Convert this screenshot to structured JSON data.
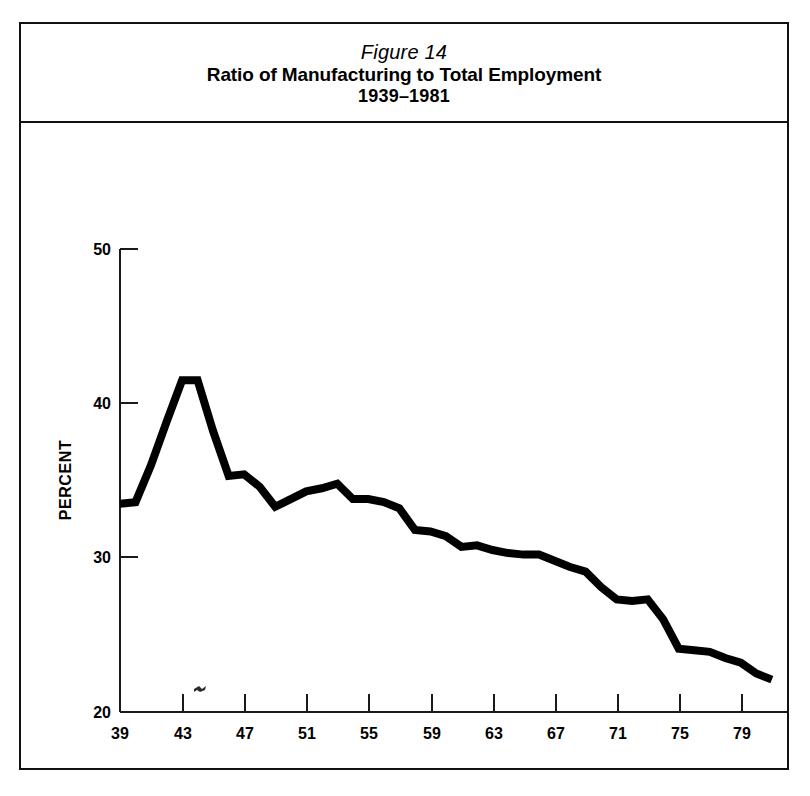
{
  "figure": {
    "number": "Figure 14",
    "title": "Ratio of Manufacturing to Total Employment",
    "period": "1939–1981"
  },
  "chart_data": {
    "type": "line",
    "title": "Ratio of Manufacturing to Total Employment",
    "subtitle": "1939–1981",
    "figure_label": "Figure 14",
    "xlabel": "YEAR",
    "ylabel": "PERCENT",
    "xlim": [
      39,
      81
    ],
    "ylim": [
      20,
      50
    ],
    "grid": false,
    "legend": null,
    "x_tick_labels": [
      "39",
      "43",
      "47",
      "51",
      "55",
      "59",
      "63",
      "67",
      "71",
      "75",
      "79"
    ],
    "x_tick_values": [
      39,
      43,
      47,
      51,
      55,
      59,
      63,
      67,
      71,
      75,
      79
    ],
    "y_tick_labels": [
      "20",
      "30",
      "40",
      "50"
    ],
    "y_tick_values": [
      20,
      30,
      40,
      50
    ],
    "line_color": "#000000",
    "x": [
      1939,
      1940,
      1941,
      1942,
      1943,
      1944,
      1945,
      1946,
      1947,
      1948,
      1949,
      1950,
      1951,
      1952,
      1953,
      1954,
      1955,
      1956,
      1957,
      1958,
      1959,
      1960,
      1961,
      1962,
      1963,
      1964,
      1965,
      1966,
      1967,
      1968,
      1969,
      1970,
      1971,
      1972,
      1973,
      1974,
      1975,
      1976,
      1977,
      1978,
      1979,
      1980,
      1981
    ],
    "values": [
      33.5,
      33.6,
      36.0,
      38.8,
      41.5,
      41.5,
      38.2,
      35.3,
      35.4,
      34.6,
      33.3,
      33.8,
      34.3,
      34.5,
      34.8,
      33.8,
      33.8,
      33.6,
      33.2,
      31.8,
      31.7,
      31.4,
      30.7,
      30.8,
      30.5,
      30.3,
      30.2,
      30.2,
      29.8,
      29.4,
      29.1,
      28.1,
      27.3,
      27.2,
      27.3,
      26.0,
      24.1,
      24.0,
      23.9,
      23.5,
      23.2,
      22.5,
      22.1
    ],
    "annotations": [
      {
        "type": "ink-speck",
        "x": 44.0,
        "y": 20.4
      }
    ]
  }
}
